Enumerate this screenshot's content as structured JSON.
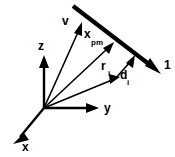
{
  "figure": {
    "background_color": "#ffffff",
    "stroke_color": "#000000",
    "width": 175,
    "height": 157
  },
  "axes": {
    "origin": {
      "x": 44,
      "y": 108
    },
    "items": [
      {
        "id": "z",
        "label": "z",
        "label_x": 41,
        "label_y": 47,
        "tip_x": 44,
        "tip_y": 57,
        "direction": "up"
      },
      {
        "id": "y",
        "label": "y",
        "label_x": 106,
        "label_y": 109,
        "tip_x": 98,
        "tip_y": 108,
        "direction": "right"
      },
      {
        "id": "x",
        "label": "x",
        "label_x": 25,
        "label_y": 148,
        "tip_x": 14,
        "tip_y": 142,
        "direction": "down-left"
      }
    ]
  },
  "ray": {
    "label": "1",
    "label_x": 166,
    "label_y": 66,
    "start_x": 73,
    "start_y": 6,
    "end_x": 160,
    "end_y": 73,
    "arrow_at": "end"
  },
  "vectors": [
    {
      "id": "v",
      "label": "v",
      "subscript": "",
      "label_x": 65,
      "label_y": 22,
      "from_x": 44,
      "from_y": 108,
      "to_x": 82,
      "to_y": 23
    },
    {
      "id": "x_pm",
      "label": "x",
      "subscript": "pm",
      "label_x": 88,
      "label_y": 36,
      "from_x": 44,
      "from_y": 108,
      "to_x": 113,
      "to_y": 43
    },
    {
      "id": "r_i",
      "label": "r",
      "subscript": "i",
      "label_x": 104,
      "label_y": 68,
      "from_x": 44,
      "from_y": 108,
      "to_x": 119,
      "to_y": 77
    },
    {
      "id": "d_i",
      "label": "d",
      "subscript": "i",
      "label_x": 123,
      "label_y": 77,
      "from_x": 116,
      "from_y": 78,
      "to_x": 134,
      "to_y": 56
    }
  ]
}
